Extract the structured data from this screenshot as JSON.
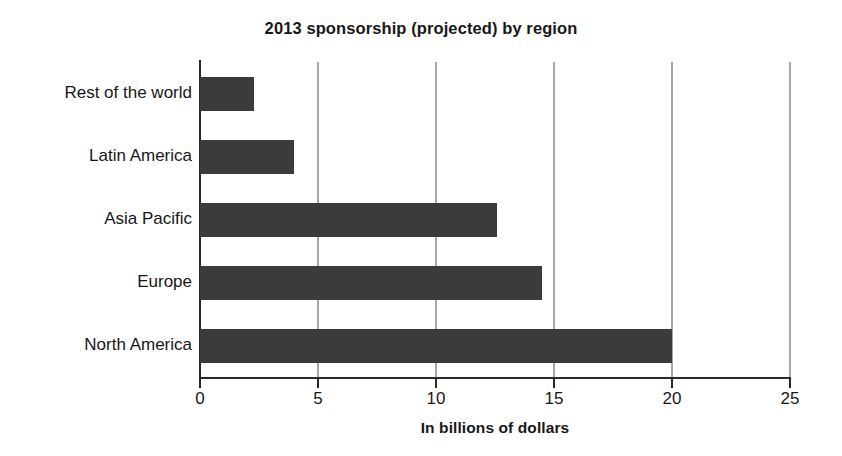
{
  "chart_data": {
    "type": "bar",
    "orientation": "horizontal",
    "title": "2013 sponsorship (projected) by region",
    "xlabel": "In billions of dollars",
    "ylabel": "",
    "categories": [
      "Rest of the world",
      "Latin America",
      "Asia Pacific",
      "Europe",
      "North America"
    ],
    "values": [
      2.3,
      4.0,
      12.6,
      14.5,
      20.0
    ],
    "xlim": [
      0,
      25
    ],
    "xticks": [
      0,
      5,
      10,
      15,
      20,
      25
    ],
    "xtick_labels": [
      "0",
      "5",
      "10",
      "15",
      "20",
      "25"
    ],
    "grid": "vertical",
    "legend": "none",
    "bar_color": "#3b3b3b",
    "background_color": "#ffffff",
    "axis_color": "#2a2a2a",
    "gridline_color": "#a7a7a7"
  }
}
